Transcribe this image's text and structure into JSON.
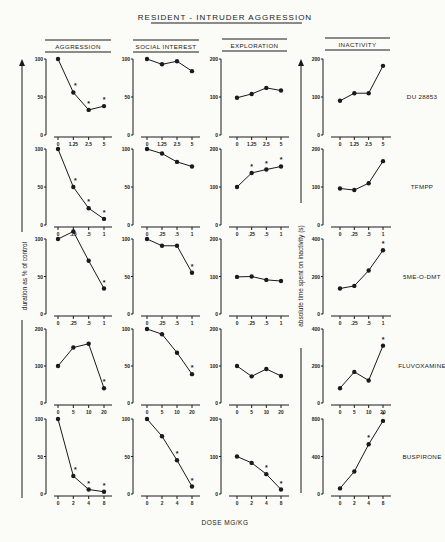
{
  "title": "RESIDENT - INTRUDER AGGRESSION",
  "y_label_left": "duration as % of control",
  "y_label_right": "absolute time spent on inactivity (s)",
  "x_label": "DOSE  MG/KG",
  "column_headers": [
    "AGGRESSION",
    "SOCIAL INTEREST",
    "EXPLORATION",
    "INACTIVITY"
  ],
  "chart_data": {
    "type": "line",
    "title": "RESIDENT - INTRUDER AGGRESSION",
    "xlabel": "DOSE MG/KG",
    "ylabel_left": "duration as % of control",
    "ylabel_right": "absolute time spent on inactivity (s)",
    "grid": false,
    "rows": [
      {
        "drug": "DU 28853",
        "doses": [
          "0",
          "1.25",
          "2.5",
          "5"
        ],
        "panels": [
          {
            "measure": "AGGRESSION",
            "ylim": [
              0,
              100
            ],
            "yticks": [
              0,
              50,
              100
            ],
            "values": [
              100,
              56,
              33,
              38
            ],
            "significant": [
              false,
              true,
              true,
              true
            ]
          },
          {
            "measure": "SOCIAL INTEREST",
            "ylim": [
              0,
              100
            ],
            "yticks": [
              0,
              50,
              100
            ],
            "values": [
              100,
              93,
              97,
              84
            ],
            "significant": [
              false,
              false,
              false,
              false
            ]
          },
          {
            "measure": "EXPLORATION",
            "ylim": [
              0,
              200
            ],
            "yticks": [
              0,
              100,
              200
            ],
            "values": [
              98,
              108,
              124,
              117
            ],
            "significant": [
              false,
              false,
              false,
              false
            ]
          },
          {
            "measure": "INACTIVITY",
            "ylim": [
              0,
              200
            ],
            "yticks": [
              0,
              100,
              200
            ],
            "values": [
              90,
              110,
              110,
              182
            ],
            "significant": [
              false,
              false,
              false,
              false
            ]
          }
        ]
      },
      {
        "drug": "TFMPP",
        "doses": [
          "0",
          ".25",
          ".5",
          "1"
        ],
        "panels": [
          {
            "measure": "AGGRESSION",
            "ylim": [
              0,
              100
            ],
            "yticks": [
              0,
              50,
              100
            ],
            "values": [
              100,
              50,
              22,
              8
            ],
            "significant": [
              false,
              true,
              true,
              true
            ]
          },
          {
            "measure": "SOCIAL INTEREST",
            "ylim": [
              0,
              100
            ],
            "yticks": [
              0,
              50,
              100
            ],
            "values": [
              100,
              94,
              83,
              77
            ],
            "significant": [
              false,
              false,
              false,
              false
            ]
          },
          {
            "measure": "EXPLORATION",
            "ylim": [
              0,
              200
            ],
            "yticks": [
              0,
              100,
              200
            ],
            "values": [
              100,
              137,
              146,
              154
            ],
            "significant": [
              false,
              true,
              true,
              true
            ]
          },
          {
            "measure": "INACTIVITY",
            "ylim": [
              0,
              200
            ],
            "yticks": [
              0,
              100,
              200
            ],
            "values": [
              96,
              92,
              110,
              168
            ],
            "significant": [
              false,
              false,
              false,
              false
            ]
          }
        ]
      },
      {
        "drug": "5ME-O-DMT",
        "doses": [
          "0",
          ".25",
          ".5",
          "1"
        ],
        "panels": [
          {
            "measure": "AGGRESSION",
            "ylim": [
              0,
              100
            ],
            "yticks": [
              0,
              50,
              100
            ],
            "values": [
              100,
              110,
              71,
              34
            ],
            "significant": [
              false,
              false,
              false,
              true
            ]
          },
          {
            "measure": "SOCIAL INTEREST",
            "ylim": [
              0,
              100
            ],
            "yticks": [
              0,
              50,
              100
            ],
            "values": [
              100,
              91,
              91,
              55
            ],
            "significant": [
              false,
              false,
              false,
              true
            ]
          },
          {
            "measure": "EXPLORATION",
            "ylim": [
              0,
              200
            ],
            "yticks": [
              0,
              100,
              200
            ],
            "values": [
              99,
              100,
              91,
              88
            ],
            "significant": [
              false,
              false,
              false,
              false
            ]
          },
          {
            "measure": "INACTIVITY",
            "ylim": [
              0,
              400
            ],
            "yticks": [
              0,
              200,
              400
            ],
            "values": [
              136,
              150,
              232,
              340
            ],
            "significant": [
              false,
              false,
              false,
              true
            ]
          }
        ]
      },
      {
        "drug": "FLUVOXAMINE",
        "doses": [
          "0",
          "5",
          "10",
          "20"
        ],
        "panels": [
          {
            "measure": "AGGRESSION",
            "ylim": [
              0,
              200
            ],
            "yticks": [
              0,
              100,
              200
            ],
            "values": [
              100,
              150,
              160,
              40
            ],
            "significant": [
              false,
              false,
              false,
              true
            ]
          },
          {
            "measure": "SOCIAL INTEREST",
            "ylim": [
              0,
              100
            ],
            "yticks": [
              0,
              50,
              100
            ],
            "values": [
              100,
              93,
              68,
              39
            ],
            "significant": [
              false,
              false,
              false,
              true
            ]
          },
          {
            "measure": "EXPLORATION",
            "ylim": [
              0,
              200
            ],
            "yticks": [
              0,
              100,
              200
            ],
            "values": [
              100,
              72,
              92,
              73
            ],
            "significant": [
              false,
              false,
              false,
              false
            ]
          },
          {
            "measure": "INACTIVITY",
            "ylim": [
              0,
              400
            ],
            "yticks": [
              0,
              200,
              400
            ],
            "values": [
              80,
              168,
              122,
              310
            ],
            "significant": [
              false,
              false,
              false,
              true
            ]
          }
        ]
      },
      {
        "drug": "BUSPIRONE",
        "doses": [
          "0",
          "2",
          "4",
          "8"
        ],
        "panels": [
          {
            "measure": "AGGRESSION",
            "ylim": [
              0,
              100
            ],
            "yticks": [
              0,
              50,
              100
            ],
            "values": [
              100,
              24,
              6,
              3
            ],
            "significant": [
              false,
              true,
              true,
              true
            ]
          },
          {
            "measure": "SOCIAL INTEREST",
            "ylim": [
              0,
              100
            ],
            "yticks": [
              0,
              50,
              100
            ],
            "values": [
              100,
              77,
              45,
              10
            ],
            "significant": [
              false,
              false,
              true,
              true
            ]
          },
          {
            "measure": "EXPLORATION",
            "ylim": [
              0,
              200
            ],
            "yticks": [
              0,
              100,
              200
            ],
            "values": [
              100,
              83,
              53,
              12
            ],
            "significant": [
              false,
              false,
              true,
              true
            ]
          },
          {
            "measure": "INACTIVITY",
            "ylim": [
              0,
              800
            ],
            "yticks": [
              0,
              400,
              800
            ],
            "values": [
              60,
              240,
              530,
              780
            ],
            "significant": [
              false,
              false,
              true,
              true
            ]
          }
        ]
      }
    ]
  }
}
